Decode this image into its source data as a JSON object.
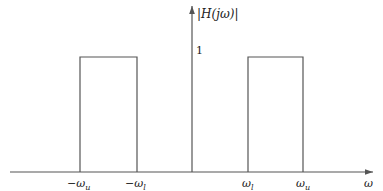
{
  "diagram": {
    "title_label": "|H(jω)|",
    "y_tick_label": "1",
    "x_labels": [
      {
        "text": "−ω",
        "sub": "u",
        "x": 80
      },
      {
        "text": "−ω",
        "sub": "l",
        "x": 137
      },
      {
        "text": "ω",
        "sub": "l",
        "x": 248
      },
      {
        "text": "ω",
        "sub": "u",
        "x": 303
      }
    ],
    "x_axis_label": "ω",
    "colors": {
      "stroke": "#555555",
      "text": "#222222"
    }
  }
}
